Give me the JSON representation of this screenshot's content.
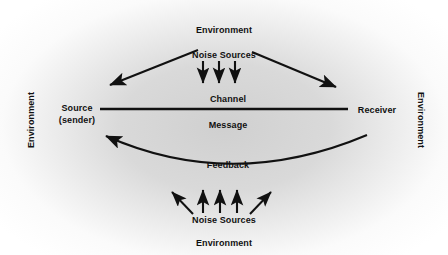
{
  "diagram": {
    "background_color": "#ffffff",
    "wash_color": "#d2d2d2",
    "ink_color": "#111111",
    "labels": {
      "environment_top": "Environment",
      "environment_bottom": "Environment",
      "environment_left": "Environment",
      "environment_right": "Environment",
      "noise_sources_top": "Noise Sources",
      "noise_sources_bottom": "Noise Sources",
      "source_line1": "Source",
      "source_line2": "(sender)",
      "receiver": "Receiver",
      "channel": "Channel",
      "message": "Message",
      "feedback": "Feedback"
    },
    "elements": {
      "channel_line": {
        "name": "channel-line",
        "x1": 100,
        "y1": 109,
        "x2": 348,
        "y2": 109
      },
      "feedback_curve": {
        "name": "feedback-curve",
        "start_x": 367,
        "start_y": 135,
        "ctrl_x": 232,
        "ctrl_y": 185,
        "end_x": 103,
        "end_y": 136,
        "arrow_at": "end"
      },
      "top_noise_arrows": [
        {
          "name": "noise-arrow-top-left-diagonal",
          "x1": 198,
          "y1": 50,
          "x2": 107,
          "y2": 86
        },
        {
          "name": "noise-arrow-top-down-1",
          "x1": 203,
          "y1": 60,
          "x2": 203,
          "y2": 85
        },
        {
          "name": "noise-arrow-top-down-2",
          "x1": 219,
          "y1": 60,
          "x2": 219,
          "y2": 85
        },
        {
          "name": "noise-arrow-top-down-3",
          "x1": 235,
          "y1": 60,
          "x2": 235,
          "y2": 85
        },
        {
          "name": "noise-arrow-top-right-diagonal",
          "x1": 252,
          "y1": 52,
          "x2": 339,
          "y2": 88
        }
      ],
      "bottom_noise_arrows": [
        {
          "name": "noise-arrow-bottom-left-diagonal",
          "x1": 192,
          "y1": 214,
          "x2": 170,
          "y2": 190
        },
        {
          "name": "noise-arrow-bottom-up-1",
          "x1": 203,
          "y1": 213,
          "x2": 203,
          "y2": 188
        },
        {
          "name": "noise-arrow-bottom-up-2",
          "x1": 220,
          "y1": 213,
          "x2": 220,
          "y2": 188
        },
        {
          "name": "noise-arrow-bottom-up-3",
          "x1": 237,
          "y1": 213,
          "x2": 237,
          "y2": 188
        },
        {
          "name": "noise-arrow-bottom-right-diagonal",
          "x1": 251,
          "y1": 214,
          "x2": 272,
          "y2": 190
        }
      ]
    },
    "label_positions": {
      "environment_top": {
        "x": 224,
        "y": 30
      },
      "noise_sources_top": {
        "x": 224,
        "y": 55
      },
      "channel": {
        "x": 228,
        "y": 99
      },
      "message": {
        "x": 228,
        "y": 125
      },
      "source": {
        "x": 77,
        "y": 114
      },
      "receiver": {
        "x": 375,
        "y": 110
      },
      "feedback": {
        "x": 228,
        "y": 165
      },
      "noise_sources_bottom": {
        "x": 224,
        "y": 220
      },
      "environment_bottom": {
        "x": 224,
        "y": 243
      },
      "environment_left": {
        "x": 31,
        "y": 120
      },
      "environment_right": {
        "x": 420,
        "y": 120
      }
    }
  }
}
